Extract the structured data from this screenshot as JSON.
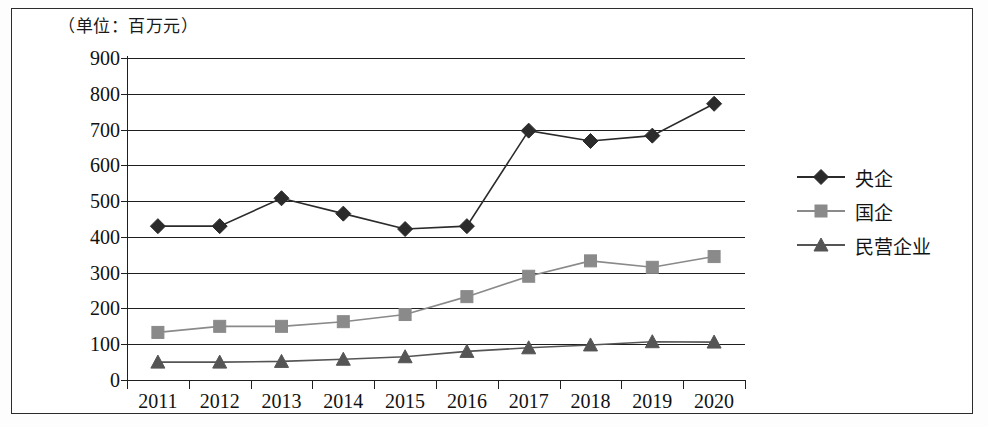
{
  "figure": {
    "unit_label": "（单位：百万元）"
  },
  "legend": {
    "position": "right",
    "items": [
      {
        "label": "央企",
        "marker": "diamond-marker",
        "color": "#2b2b2b"
      },
      {
        "label": "国企",
        "marker": "square-marker",
        "color": "#8a8a8a"
      },
      {
        "label": "民营企业",
        "marker": "triangle-marker",
        "color": "#555555"
      }
    ]
  },
  "chart_data": {
    "type": "line",
    "title": "",
    "subtitle": "",
    "xlabel": "",
    "ylabel": "",
    "unit": "百万元",
    "categories": [
      "2011",
      "2012",
      "2013",
      "2014",
      "2015",
      "2016",
      "2017",
      "2018",
      "2019",
      "2020"
    ],
    "ylim": [
      0,
      900
    ],
    "ytick_labels": [
      "0",
      "100",
      "200",
      "300",
      "400",
      "500",
      "600",
      "700",
      "800",
      "900"
    ],
    "ytick_values": [
      0,
      100,
      200,
      300,
      400,
      500,
      600,
      700,
      800,
      900
    ],
    "grid": true,
    "grid_axis": "y",
    "legend_position": "right",
    "series": [
      {
        "name": "央企",
        "marker": "diamond",
        "color": "#2b2b2b",
        "values": [
          430,
          430,
          508,
          465,
          422,
          430,
          697,
          668,
          683,
          772
        ]
      },
      {
        "name": "国企",
        "marker": "square",
        "color": "#8a8a8a",
        "values": [
          133,
          150,
          150,
          163,
          183,
          233,
          290,
          333,
          315,
          345
        ]
      },
      {
        "name": "民营企业",
        "marker": "triangle",
        "color": "#555555",
        "values": [
          50,
          50,
          52,
          58,
          65,
          80,
          90,
          98,
          107,
          106
        ]
      }
    ]
  }
}
